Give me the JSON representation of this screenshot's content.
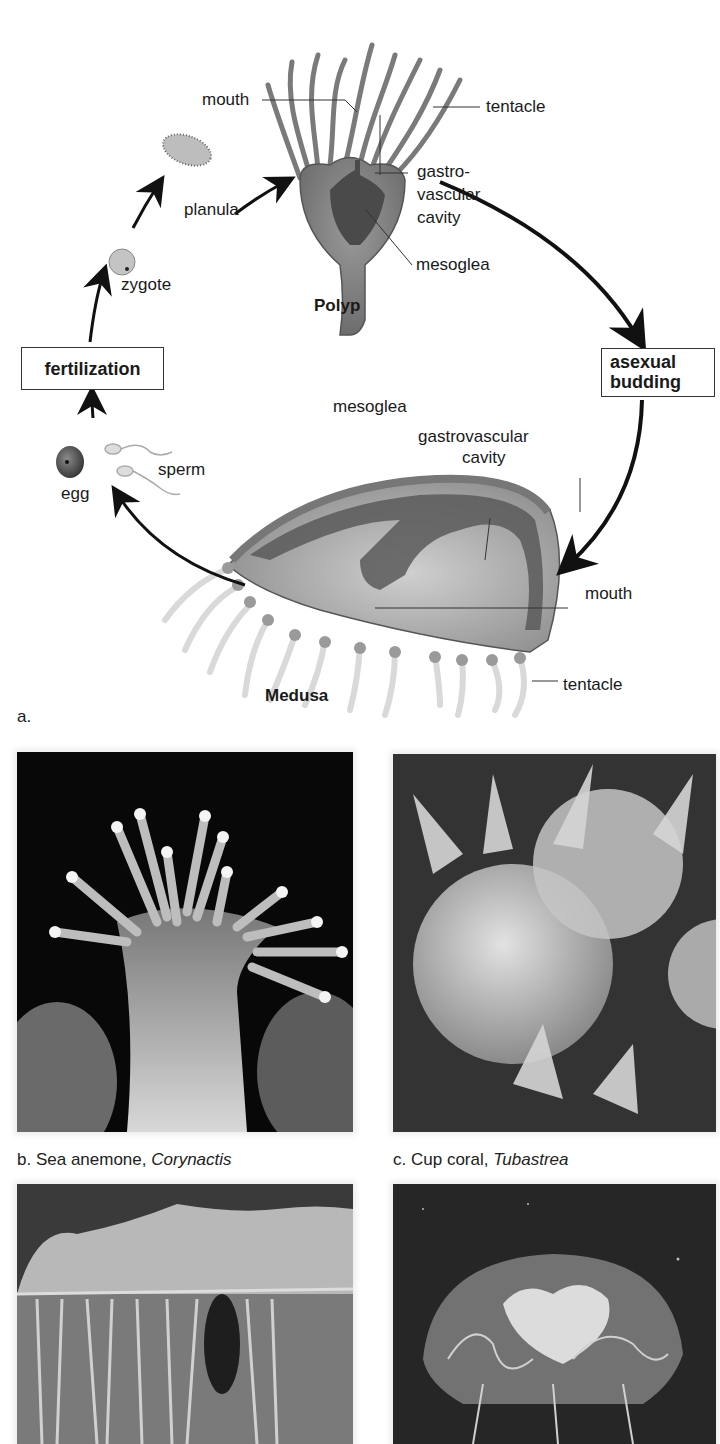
{
  "figure": {
    "panel_a_label": "a.",
    "polyp": {
      "title": "Polyp",
      "labels": {
        "mouth": "mouth",
        "tentacle": "tentacle",
        "gastro_line1": "gastro-",
        "gastro_line2": "vascular",
        "gastro_line3": "cavity",
        "mesoglea": "mesoglea"
      }
    },
    "medusa": {
      "title": "Medusa",
      "labels": {
        "mesoglea": "mesoglea",
        "gastro_line1": "gastrovascular",
        "gastro_line2": "cavity",
        "mouth": "mouth",
        "tentacle": "tentacle"
      }
    },
    "stages": {
      "planula": "planula",
      "zygote": "zygote",
      "egg": "egg",
      "sperm": "sperm"
    },
    "process_boxes": {
      "fertilization": "fertilization",
      "asexual_line1": "asexual",
      "asexual_line2": "budding"
    },
    "photos": [
      {
        "letter": "b.",
        "common": "Sea anemone,",
        "genus": "Corynactis"
      },
      {
        "letter": "c.",
        "common": "Cup coral,",
        "genus": "Tubastrea"
      },
      {
        "letter": "d.",
        "common": "",
        "genus": ""
      },
      {
        "letter": "e.",
        "common": "",
        "genus": ""
      }
    ]
  }
}
